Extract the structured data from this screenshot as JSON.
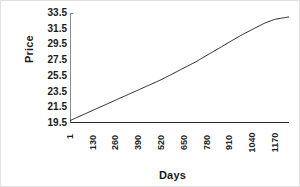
{
  "chart_data": {
    "type": "line",
    "title": "",
    "xlabel": "Days",
    "ylabel": "Price",
    "grid": false,
    "legend": false,
    "legend_position": "none",
    "line_color": "#1a1a1a",
    "xlim": [
      1,
      1250
    ],
    "ylim": [
      19.5,
      33.5
    ],
    "ytick_labels": [
      "33.5",
      "31.5",
      "29.5",
      "27.5",
      "25.5",
      "23.5",
      "21.5",
      "19.5"
    ],
    "ytick_values": [
      33.5,
      31.5,
      29.5,
      27.5,
      25.5,
      23.5,
      21.5,
      19.5
    ],
    "xtick_labels": [
      "1",
      "130",
      "260",
      "390",
      "520",
      "650",
      "780",
      "910",
      "1040",
      "1170"
    ],
    "xtick_values": [
      1,
      130,
      260,
      390,
      520,
      650,
      780,
      910,
      1040,
      1170
    ],
    "series": [
      {
        "name": "Price",
        "x": [
          1,
          60,
          130,
          200,
          260,
          330,
          390,
          460,
          520,
          590,
          650,
          720,
          780,
          850,
          910,
          980,
          1040,
          1110,
          1170,
          1250
        ],
        "values": [
          19.8,
          20.4,
          21.1,
          21.8,
          22.4,
          23.1,
          23.7,
          24.4,
          25.0,
          25.8,
          26.5,
          27.3,
          28.1,
          29.0,
          29.8,
          30.7,
          31.4,
          32.2,
          32.7,
          33.0
        ]
      }
    ]
  }
}
